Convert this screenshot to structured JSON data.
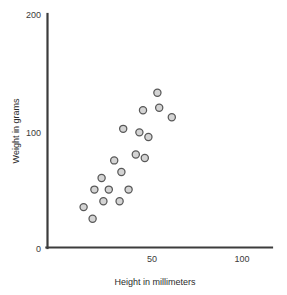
{
  "chart_data": {
    "type": "scatter",
    "title": "",
    "xlabel": "Height in millimeters",
    "ylabel": "Weight in grams",
    "xlim": [
      0,
      117
    ],
    "ylim": [
      0,
      200
    ],
    "xticks": [
      50,
      100
    ],
    "xtick_labels": [
      "50",
      "100"
    ],
    "yticks": [
      0,
      100,
      200
    ],
    "ytick_labels": [
      "0",
      "100",
      "200"
    ],
    "grid": false,
    "legend": null,
    "marker_style": {
      "shape": "circle",
      "fill": "#d4d4d4",
      "stroke": "#585858",
      "radius_px": 3.6
    },
    "axis_color": "#3c3c3c",
    "background": "#ffffff",
    "n_points": 19,
    "points": [
      {
        "x": 12,
        "y": 35
      },
      {
        "x": 17,
        "y": 25
      },
      {
        "x": 18,
        "y": 50
      },
      {
        "x": 22,
        "y": 60
      },
      {
        "x": 23,
        "y": 40
      },
      {
        "x": 26,
        "y": 50
      },
      {
        "x": 29,
        "y": 75
      },
      {
        "x": 32,
        "y": 40
      },
      {
        "x": 33,
        "y": 65
      },
      {
        "x": 34,
        "y": 102
      },
      {
        "x": 37,
        "y": 50
      },
      {
        "x": 41,
        "y": 80
      },
      {
        "x": 43,
        "y": 99
      },
      {
        "x": 45,
        "y": 118
      },
      {
        "x": 46,
        "y": 77
      },
      {
        "x": 48,
        "y": 95
      },
      {
        "x": 53,
        "y": 133
      },
      {
        "x": 54,
        "y": 120
      },
      {
        "x": 61,
        "y": 112
      }
    ],
    "series": [
      {
        "name": "observations",
        "x": [
          12,
          17,
          18,
          22,
          23,
          26,
          29,
          32,
          33,
          34,
          37,
          41,
          43,
          45,
          46,
          48,
          53,
          54,
          61
        ],
        "y": [
          35,
          25,
          50,
          60,
          40,
          50,
          75,
          40,
          65,
          102,
          50,
          80,
          99,
          118,
          77,
          95,
          133,
          120,
          112
        ]
      }
    ]
  },
  "geometry": {
    "plot_left_px": 47,
    "plot_bottom_px": 248,
    "plot_right_px": 272,
    "plot_top_px": 15,
    "x_origin_px": 62,
    "px_per_x_unit": 1.8,
    "y_zero_px": 248,
    "px_per_y_unit": 1.168
  }
}
